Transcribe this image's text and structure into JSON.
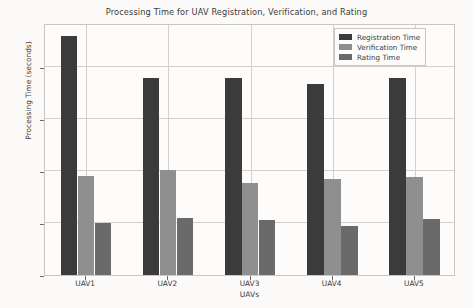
{
  "chart_data": {
    "type": "bar",
    "title": "Processing Time for UAV Registration, Verification, and Rating",
    "xlabel": "UAVs",
    "ylabel": "Processing Time (seconds)",
    "categories": [
      "UAV1",
      "UAV2",
      "UAV3",
      "UAV4",
      "UAV5"
    ],
    "series": [
      {
        "name": "Registration Time",
        "color": "#3b3b3b",
        "values": [
          4.6,
          3.8,
          3.8,
          3.68,
          3.8
        ]
      },
      {
        "name": "Verification Time",
        "color": "#8f8f8f",
        "values": [
          1.9,
          2.02,
          1.78,
          1.85,
          1.88
        ]
      },
      {
        "name": "Rating Time",
        "color": "#6a6a6a",
        "values": [
          1.0,
          1.1,
          1.05,
          0.95,
          1.08
        ]
      }
    ],
    "ylim": [
      0,
      4.85
    ],
    "yticks": [
      0,
      1,
      2,
      3,
      4
    ],
    "ytick_labels": [
      "0",
      "1",
      "2",
      "3",
      "4"
    ],
    "grid": true,
    "legend_position": "upper right"
  }
}
